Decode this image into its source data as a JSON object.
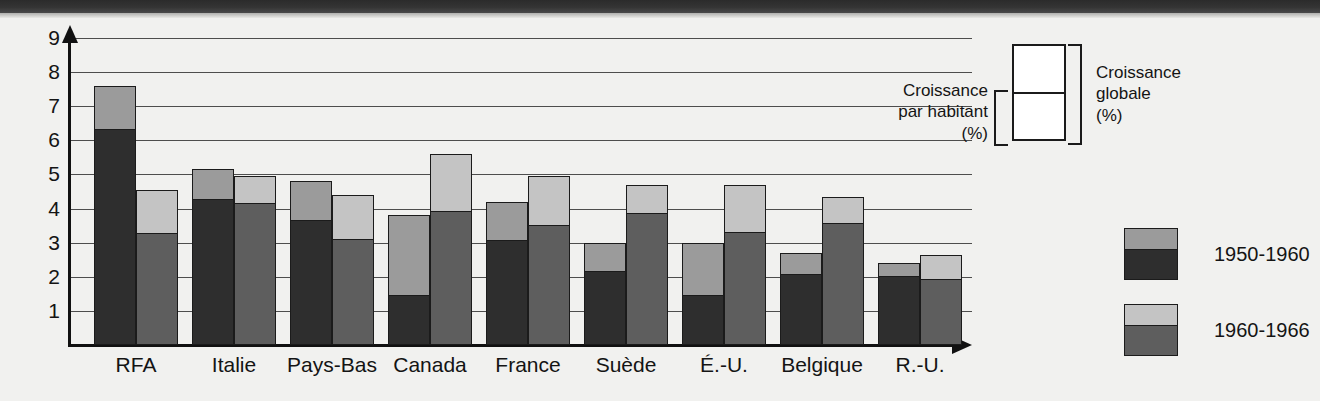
{
  "chart_data": {
    "type": "bar",
    "title": "",
    "subtitle": "",
    "xlabel": "",
    "ylabel": "",
    "ylim": [
      0,
      9
    ],
    "yticks": [
      1,
      2,
      3,
      4,
      5,
      6,
      7,
      8,
      9
    ],
    "grid": true,
    "stacked": true,
    "legend_position": "right",
    "categories": [
      "RFA",
      "Italie",
      "Pays-Bas",
      "Canada",
      "France",
      "Suède",
      "É.-U.",
      "Belgique",
      "R.-U."
    ],
    "series": [
      {
        "name": "1950-1960",
        "note": "bar total = croissance globale (%); dark lower segment = croissance par habitant (%)",
        "total_values": [
          7.6,
          5.15,
          4.8,
          3.8,
          4.2,
          3.0,
          3.0,
          2.7,
          2.4
        ],
        "per_capita_values": [
          6.35,
          4.3,
          3.7,
          1.5,
          3.1,
          2.2,
          1.5,
          2.1,
          2.05
        ],
        "color_total": "#9b9b9b",
        "color_per_capita": "#2e2e2e"
      },
      {
        "name": "1960-1966",
        "note": "bar total = croissance globale (%); dark lower segment = croissance par habitant (%)",
        "total_values": [
          4.55,
          4.95,
          4.4,
          5.6,
          4.95,
          4.7,
          4.7,
          4.35,
          2.65
        ],
        "per_capita_values": [
          3.3,
          4.2,
          3.15,
          3.95,
          3.55,
          3.9,
          3.35,
          3.6,
          1.95
        ],
        "color_total": "#c4c4c4",
        "color_per_capita": "#5e5e5e"
      }
    ]
  },
  "legend": {
    "schematic": {
      "left_label": "Croissance\npar habitant\n(%)",
      "right_label": "Croissance\nglobale\n(%)"
    },
    "periods": [
      {
        "label": "1950-1960"
      },
      {
        "label": "1960-1966"
      }
    ]
  },
  "colors": {
    "background": "#f1f1ef",
    "axis": "#111111",
    "gridline": "#4d4d4d",
    "outline": "#1b1b1b",
    "period1_total": "#9b9b9b",
    "period1_per_capita": "#2e2e2e",
    "period2_total": "#c4c4c4",
    "period2_per_capita": "#5e5e5e"
  }
}
